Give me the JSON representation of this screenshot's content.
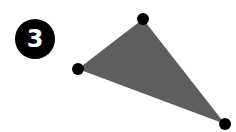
{
  "badge": {
    "label": "3"
  },
  "triangle": {
    "fill": "#5e5e5e",
    "vertex_color": "#000000",
    "vertices": [
      {
        "x": 143,
        "y": 19
      },
      {
        "x": 78,
        "y": 69
      },
      {
        "x": 225,
        "y": 124
      }
    ]
  }
}
